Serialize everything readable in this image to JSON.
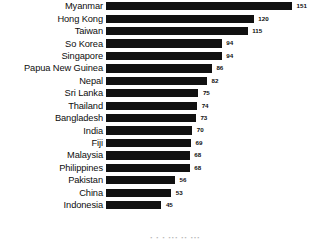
{
  "chart_data": {
    "type": "bar",
    "orientation": "horizontal",
    "title": "",
    "xlabel": "",
    "ylabel": "",
    "grid": false,
    "legend": null,
    "xlim": [
      0,
      151
    ],
    "bar_color": "#111111",
    "background_color": "#ffffff",
    "categories": [
      "Myanmar",
      "Hong Kong",
      "Taiwan",
      "So Korea",
      "Singapore",
      "Papua New Guinea",
      "Nepal",
      "Sri Lanka",
      "Thailand",
      "Bangladesh",
      "India",
      "Fiji",
      "Malaysia",
      "Philippines",
      "Pakistan",
      "China",
      "Indonesia"
    ],
    "values": [
      151,
      120,
      115,
      94,
      94,
      86,
      82,
      75,
      74,
      73,
      70,
      69,
      68,
      68,
      56,
      53,
      45
    ],
    "value_labels": [
      "151",
      "120",
      "115",
      "94",
      "94",
      "86",
      "82",
      "75",
      "74",
      "73",
      "70",
      "69",
      "68",
      "68",
      "56",
      "53",
      "45"
    ]
  },
  "footer": {
    "cut_off_text": "    ·   ·  ·  ··· ·· ···"
  }
}
